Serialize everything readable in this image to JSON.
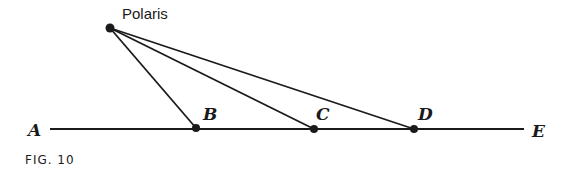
{
  "figure": {
    "caption": "FIG. 10",
    "stroke_color": "#1a1a1a",
    "star": {
      "label": "Polaris",
      "x": 110,
      "y": 28
    },
    "baseline": {
      "x1": 50,
      "x2": 524,
      "y": 129
    },
    "endpoints": [
      {
        "label": "A",
        "label_x": 28,
        "label_y": 136
      },
      {
        "label": "E",
        "label_x": 532,
        "label_y": 137
      }
    ],
    "points": [
      {
        "label": "B",
        "x": 196,
        "y": 128,
        "label_x": 203,
        "label_y": 120
      },
      {
        "label": "C",
        "x": 314,
        "y": 129,
        "label_x": 316,
        "label_y": 120
      },
      {
        "label": "D",
        "x": 414,
        "y": 129,
        "label_x": 418,
        "label_y": 120
      }
    ]
  }
}
